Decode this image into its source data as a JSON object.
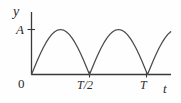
{
  "figure": {
    "caption": "",
    "background_color": "#fefefe",
    "line_color": "#4a4a4a",
    "axis_color": "#3a3a3a"
  },
  "axes": {
    "y_axis_label": "y",
    "x_axis_label": "t",
    "origin_label": "0",
    "amplitude_label": "A",
    "x_ticks": [
      {
        "label": "T/2",
        "value": 0.5
      },
      {
        "label": "T",
        "value": 1.0
      }
    ],
    "y_ticks": [
      {
        "label": "A",
        "value": 1.0
      }
    ]
  },
  "chart_data": {
    "type": "line",
    "title": "",
    "xlabel": "t",
    "ylabel": "y",
    "xlim": [
      0,
      1.35
    ],
    "ylim": [
      0,
      1.18
    ],
    "grid": false,
    "legend": "none",
    "annotations": [
      {
        "text": "A",
        "axis": "y",
        "value": 1.0
      },
      {
        "text": "T/2",
        "axis": "x",
        "value": 0.5
      },
      {
        "text": "T",
        "axis": "x",
        "value": 1.0
      },
      {
        "text": "0",
        "axis": "origin",
        "value": 0
      }
    ],
    "function": "y = A*|sin(2*pi*t/T)|",
    "period": 0.5,
    "amplitude": 1.0,
    "series": [
      {
        "name": "rectified-sine",
        "x": [
          0.0,
          0.025,
          0.05,
          0.075,
          0.1,
          0.125,
          0.15,
          0.175,
          0.2,
          0.225,
          0.25,
          0.275,
          0.3,
          0.325,
          0.35,
          0.375,
          0.4,
          0.425,
          0.45,
          0.475,
          0.5,
          0.525,
          0.55,
          0.575,
          0.6,
          0.625,
          0.65,
          0.675,
          0.7,
          0.725,
          0.75,
          0.775,
          0.8,
          0.825,
          0.85,
          0.875,
          0.9,
          0.925,
          0.95,
          0.975,
          1.0,
          1.025,
          1.05,
          1.075,
          1.1,
          1.125,
          1.15,
          1.175,
          1.2,
          1.225,
          1.25,
          1.275,
          1.3,
          1.325,
          1.35
        ],
        "y": [
          0.0,
          0.156,
          0.309,
          0.454,
          0.588,
          0.707,
          0.809,
          0.891,
          0.951,
          0.988,
          1.0,
          0.988,
          0.951,
          0.891,
          0.809,
          0.707,
          0.588,
          0.454,
          0.309,
          0.156,
          0.0,
          0.156,
          0.309,
          0.454,
          0.588,
          0.707,
          0.809,
          0.891,
          0.951,
          0.988,
          1.0,
          0.988,
          0.951,
          0.891,
          0.809,
          0.707,
          0.588,
          0.454,
          0.309,
          0.156,
          0.0,
          0.156,
          0.309,
          0.454,
          0.588,
          0.707,
          0.809,
          0.891,
          0.951,
          0.988,
          1.0,
          0.988,
          0.951,
          0.891,
          0.809
        ]
      }
    ]
  }
}
